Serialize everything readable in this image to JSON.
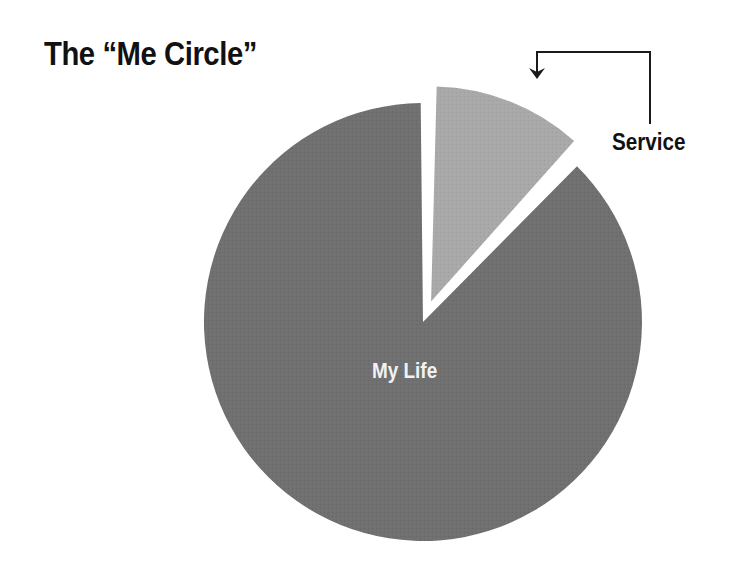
{
  "title": "The “Me Circle”",
  "chart_data": {
    "type": "pie",
    "title": "The “Me Circle”",
    "categories": [
      "My Life",
      "Service"
    ],
    "values": [
      88,
      12
    ],
    "colors": [
      "#707070",
      "#a9a9a9"
    ],
    "exploded": [
      "Service"
    ],
    "start_angle_deg": 0,
    "direction": "clockwise",
    "annotations": [
      {
        "text": "Service",
        "type": "callout-arrow",
        "points_to": "Service"
      },
      {
        "text": "My Life",
        "type": "inside-label",
        "points_to": "My Life"
      }
    ],
    "legend": "none",
    "grid": false
  },
  "labels": {
    "main": "My Life",
    "service": "Service"
  }
}
